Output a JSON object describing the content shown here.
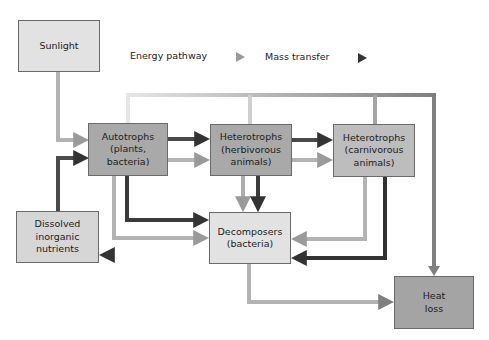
{
  "legend": {
    "energy_label": "Energy pathway",
    "mass_label": "Mass transfer"
  },
  "colors": {
    "energy_arrow": "#a8a8a8",
    "mass_arrow": "#3a3a3a",
    "node_light": "#e2e2e2",
    "node_dark": "#a9a9a9",
    "border": "#6a6a6a"
  },
  "nodes": {
    "sunlight": "Sunlight",
    "autotrophs": "Autotrophs\n(plants,\nbacteria)",
    "herbivores": "Heterotrophs\n(herbivorous\nanimals)",
    "carnivores": "Heterotrophs\n(carnivorous\nanimals)",
    "nutrients": "Dissolved\ninorganic\nnutrients",
    "decomposers": "Decomposers\n(bacteria)",
    "heat_loss": "Heat\nloss"
  },
  "edges": [
    {
      "from": "Sunlight",
      "to": "Autotrophs",
      "type": "energy"
    },
    {
      "from": "Dissolved inorganic nutrients",
      "to": "Autotrophs",
      "type": "mass"
    },
    {
      "from": "Autotrophs",
      "to": "Heterotrophs (herbivorous animals)",
      "type": "mass"
    },
    {
      "from": "Autotrophs",
      "to": "Heterotrophs (herbivorous animals)",
      "type": "energy"
    },
    {
      "from": "Heterotrophs (herbivorous animals)",
      "to": "Heterotrophs (carnivorous animals)",
      "type": "mass"
    },
    {
      "from": "Heterotrophs (herbivorous animals)",
      "to": "Heterotrophs (carnivorous animals)",
      "type": "energy"
    },
    {
      "from": "Autotrophs",
      "to": "Decomposers",
      "type": "mass"
    },
    {
      "from": "Autotrophs",
      "to": "Decomposers",
      "type": "energy"
    },
    {
      "from": "Heterotrophs (herbivorous animals)",
      "to": "Decomposers",
      "type": "energy"
    },
    {
      "from": "Heterotrophs (herbivorous animals)",
      "to": "Decomposers",
      "type": "mass"
    },
    {
      "from": "Heterotrophs (carnivorous animals)",
      "to": "Decomposers",
      "type": "energy"
    },
    {
      "from": "Heterotrophs (carnivorous animals)",
      "to": "Decomposers",
      "type": "mass"
    },
    {
      "from": "Decomposers",
      "to": "Dissolved inorganic nutrients",
      "type": "mass"
    },
    {
      "from": "Decomposers",
      "to": "Heat loss",
      "type": "energy"
    },
    {
      "from": "Autotrophs / Herbivores / Carnivores",
      "to": "Heat loss",
      "type": "energy"
    }
  ]
}
